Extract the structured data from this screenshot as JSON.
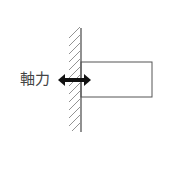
{
  "diagram": {
    "label": "軸力",
    "colors": {
      "line": "#555555",
      "arrow": "#111111",
      "label": "#444444",
      "background": "#ffffff"
    },
    "elements": {
      "wall": {
        "x": 81,
        "y1": 28,
        "y2": 132,
        "hatch_side": "left"
      },
      "beam": {
        "x": 81,
        "y": 62,
        "width": 71,
        "height": 35
      },
      "arrow": {
        "x1": 58,
        "x2": 91,
        "y": 80,
        "type": "double-headed"
      }
    }
  }
}
